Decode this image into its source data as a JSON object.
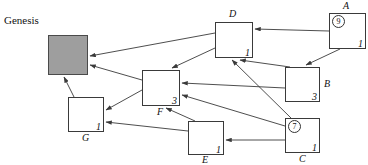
{
  "diagram": {
    "canvas": {
      "width": 368,
      "height": 165
    },
    "colors": {
      "background": "#ffffff",
      "node_fill": "#ffffff",
      "node_stroke": "#3a3a3a",
      "genesis_fill": "#9e9e9e",
      "edge_stroke": "#3a3a3a",
      "text": "#111111"
    },
    "genesis": {
      "label": "Genesis",
      "x": 48,
      "y": 35,
      "w": 40,
      "h": 40,
      "label_x": 4,
      "label_y": 14
    },
    "nodes": [
      {
        "id": "D",
        "label": "D",
        "value": "1",
        "badge": "",
        "x": 215,
        "y": 22,
        "w": 38,
        "h": 36,
        "label_pos": "top",
        "label_x": 229,
        "label_y": 8
      },
      {
        "id": "A",
        "label": "A",
        "value": "1",
        "badge": "9",
        "x": 329,
        "y": 13,
        "w": 37,
        "h": 36,
        "label_pos": "top",
        "label_x": 343,
        "label_y": 0
      },
      {
        "id": "B",
        "label": "B",
        "value": "3",
        "badge": "",
        "x": 285,
        "y": 67,
        "w": 35,
        "h": 35,
        "label_pos": "right",
        "label_x": 324,
        "label_y": 78
      },
      {
        "id": "F",
        "label": "F",
        "value": "3",
        "badge": "",
        "x": 142,
        "y": 70,
        "w": 38,
        "h": 36,
        "label_pos": "bottom",
        "label_x": 157,
        "label_y": 106
      },
      {
        "id": "G",
        "label": "G",
        "value": "1",
        "badge": "",
        "x": 68,
        "y": 97,
        "w": 36,
        "h": 35,
        "label_pos": "bottom",
        "label_x": 82,
        "label_y": 132
      },
      {
        "id": "E",
        "label": "E",
        "value": "1",
        "badge": "",
        "x": 188,
        "y": 121,
        "w": 36,
        "h": 34,
        "label_pos": "bottom",
        "label_x": 202,
        "label_y": 154
      },
      {
        "id": "C",
        "label": "C",
        "value": "1",
        "badge": "7",
        "x": 285,
        "y": 118,
        "w": 35,
        "h": 35,
        "label_pos": "bottom",
        "label_x": 299,
        "label_y": 153
      }
    ],
    "edges": [
      {
        "from": "A",
        "to": "D",
        "x1": 329,
        "y1": 31,
        "x2": 255,
        "y2": 29
      },
      {
        "from": "A",
        "to": "B",
        "x1": 340,
        "y1": 49,
        "x2": 306,
        "y2": 65
      },
      {
        "from": "B",
        "to": "D",
        "x1": 290,
        "y1": 67,
        "x2": 240,
        "y2": 60
      },
      {
        "from": "B",
        "to": "F",
        "x1": 285,
        "y1": 88,
        "x2": 182,
        "y2": 83
      },
      {
        "from": "C",
        "to": "D",
        "x1": 291,
        "y1": 118,
        "x2": 232,
        "y2": 60
      },
      {
        "from": "C",
        "to": "F",
        "x1": 285,
        "y1": 126,
        "x2": 182,
        "y2": 95
      },
      {
        "from": "C",
        "to": "E",
        "x1": 285,
        "y1": 140,
        "x2": 226,
        "y2": 140
      },
      {
        "from": "D",
        "to": "GENESIS",
        "x1": 215,
        "y1": 33,
        "x2": 90,
        "y2": 56
      },
      {
        "from": "D",
        "to": "F",
        "x1": 215,
        "y1": 48,
        "x2": 172,
        "y2": 68
      },
      {
        "from": "E",
        "to": "F",
        "x1": 195,
        "y1": 121,
        "x2": 166,
        "y2": 108
      },
      {
        "from": "E",
        "to": "G",
        "x1": 188,
        "y1": 131,
        "x2": 106,
        "y2": 122
      },
      {
        "from": "F",
        "to": "GENESIS",
        "x1": 142,
        "y1": 80,
        "x2": 90,
        "y2": 65
      },
      {
        "from": "F",
        "to": "G",
        "x1": 142,
        "y1": 90,
        "x2": 106,
        "y2": 110
      },
      {
        "from": "G",
        "to": "GENESIS",
        "x1": 74,
        "y1": 97,
        "x2": 64,
        "y2": 77
      }
    ]
  }
}
